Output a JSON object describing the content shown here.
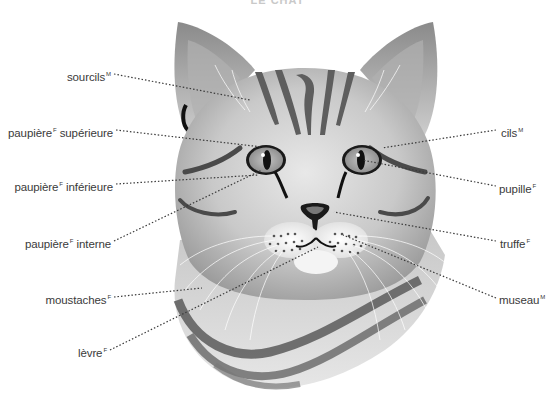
{
  "title": "LE CHAT",
  "colors": {
    "background": "#ffffff",
    "label_text": "#3a3a3a",
    "leader_line": "#3a3a3a",
    "fur_light": "#e2e2e2",
    "fur_mid": "#b8b8b8",
    "stripe": "#555555",
    "eye_iris": "#a8a8a8",
    "nose": "#1a1a1a"
  },
  "labels": [
    {
      "id": "sourcils",
      "text": "sourcils",
      "gender": "M",
      "side": "left"
    },
    {
      "id": "paupiere-superieure",
      "text": "paupière",
      "gender": "F",
      "text2": "supérieure",
      "side": "left"
    },
    {
      "id": "paupiere-inferieure",
      "text": "paupière",
      "gender": "F",
      "text2": "inférieure",
      "side": "left"
    },
    {
      "id": "paupiere-interne",
      "text": "paupière",
      "gender": "F",
      "text2": "interne",
      "side": "left"
    },
    {
      "id": "moustaches",
      "text": "moustaches",
      "gender": "F",
      "side": "left"
    },
    {
      "id": "levre",
      "text": "lèvre",
      "gender": "F",
      "side": "left"
    },
    {
      "id": "cils",
      "text": "cils",
      "gender": "M",
      "side": "right"
    },
    {
      "id": "pupille",
      "text": "pupille",
      "gender": "F",
      "side": "right"
    },
    {
      "id": "truffe",
      "text": "truffe",
      "gender": "F",
      "side": "right"
    },
    {
      "id": "museau",
      "text": "museau",
      "gender": "M",
      "side": "right"
    }
  ]
}
